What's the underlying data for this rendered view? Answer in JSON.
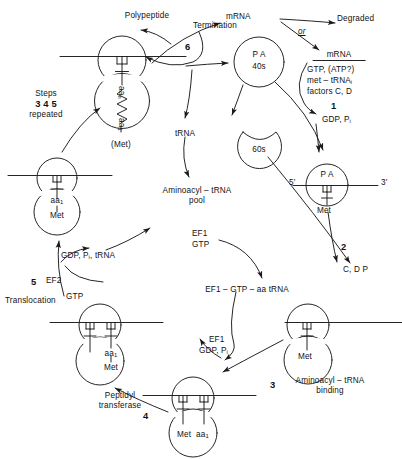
{
  "diagram": {
    "background": "#ffffff",
    "ink": "#1a1a1a"
  },
  "labels": {
    "polypeptide": "Polypeptide",
    "termination": "Termination",
    "step6": "6",
    "mrna_top": "mRNA",
    "degraded": "Degraded",
    "or": "or",
    "mrna_init": "mRNA",
    "init_line1": "GTP, (ATP?)",
    "init_line2": "met – tRNA",
    "init_line2_sub": "i",
    "init_line3": "factors  C, D",
    "step1": "1",
    "gdp_pi": "GDP, P",
    "gdp_pi_sub": "i",
    "pa40s_line1": "P A",
    "pa40s_line2": "40s",
    "sixtys": "60s",
    "trna": "tRNA",
    "aminoacyl_pool_line1": "Aminoacyl – tRNA",
    "aminoacyl_pool_line2": "pool",
    "five_prime": "5′",
    "three_prime": "3′",
    "pa_small": "P A",
    "met_initiation": "Met",
    "step2": "2",
    "cdp": "C, D P",
    "ef1": "EF1",
    "gtp_ef1": "GTP",
    "ef1_gtp_aa_trna": "EF1 – GTP – aa tRNA",
    "ef1_release": "EF1",
    "gdp_pi_release": "GDP, P",
    "gdp_pi_release_sub": "i",
    "step3": "3",
    "aminoacyl_binding_line1": "Aminoacyl – tRNA",
    "aminoacyl_binding_line2": "binding",
    "met_right": "Met",
    "step4": "4",
    "peptidyl_line1": "Peptidyl",
    "peptidyl_line2": "transferase",
    "met_bottom": "Met",
    "aa1_bottom": "aa",
    "aa1_bottom_sub": "1",
    "step5": "5",
    "ef2": "EF2",
    "gtp_ef2": "GTP",
    "gdp_pi_trna": "GDP, P",
    "gdp_pi_trna_sub": "i",
    "gdp_pi_trna_tail": ", tRNA",
    "translocation": "Translocation",
    "met_mid": "Met",
    "aa1_mid": "aa",
    "aa1_mid_sub": "1",
    "steps_line1": "Steps",
    "steps_line2": "3 4 5",
    "steps_line3": "repeated",
    "aan_top": "aa",
    "aan_top_sub": "n",
    "aa1_top": "aa",
    "aa1_top_sub": "1",
    "met_paren": "(Met)",
    "met_trans_a": "Met",
    "aa1_trans_b": "aa",
    "aa1_trans_b_sub": "1"
  }
}
